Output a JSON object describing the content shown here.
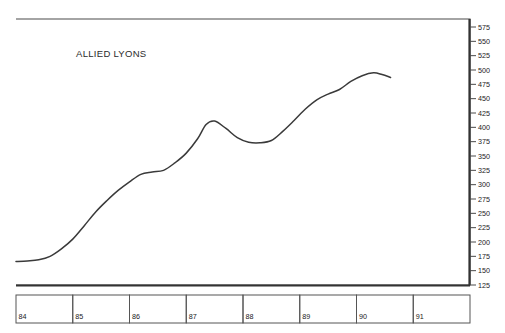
{
  "chart_data": {
    "type": "line",
    "title": "ALLIED LYONS",
    "xlabel": "",
    "ylabel": "",
    "grid": false,
    "legend_position": "none",
    "ylim": [
      125,
      575
    ],
    "ytick_step": 25,
    "yticks": [
      125,
      150,
      175,
      200,
      225,
      250,
      275,
      300,
      325,
      350,
      375,
      400,
      425,
      450,
      475,
      500,
      525,
      550,
      575
    ],
    "xlim": [
      84,
      92
    ],
    "xticks": [
      "84",
      "85",
      "86",
      "87",
      "88",
      "89",
      "90",
      "91"
    ],
    "x": [
      84.0,
      84.2,
      84.4,
      84.6,
      84.8,
      85.0,
      85.2,
      85.4,
      85.6,
      85.8,
      86.0,
      86.2,
      86.4,
      86.6,
      86.8,
      87.0,
      87.2,
      87.35,
      87.5,
      87.7,
      87.9,
      88.1,
      88.3,
      88.5,
      88.7,
      88.9,
      89.1,
      89.3,
      89.5,
      89.7,
      89.9,
      90.1,
      90.3,
      90.45,
      90.6
    ],
    "values": [
      166,
      167,
      169,
      175,
      188,
      205,
      228,
      252,
      272,
      290,
      305,
      318,
      322,
      325,
      338,
      355,
      380,
      405,
      411,
      398,
      382,
      374,
      373,
      377,
      393,
      412,
      432,
      448,
      458,
      466,
      480,
      490,
      495,
      492,
      487
    ],
    "series": [
      {
        "name": "ALLIED LYONS",
        "values": [
          166,
          167,
          169,
          175,
          188,
          205,
          228,
          252,
          272,
          290,
          305,
          318,
          322,
          325,
          338,
          355,
          380,
          405,
          411,
          398,
          382,
          374,
          373,
          377,
          393,
          412,
          432,
          448,
          458,
          466,
          480,
          490,
          495,
          492,
          487
        ]
      }
    ],
    "annotations": [
      {
        "text": "ALLIED LYONS",
        "x": 84.95,
        "y": 545
      }
    ],
    "colors": {
      "line": "#3a3a3a",
      "frame": "#4a4a4a",
      "axis": "#333333",
      "text": "#1a1a1a",
      "background": "#ffffff"
    }
  }
}
